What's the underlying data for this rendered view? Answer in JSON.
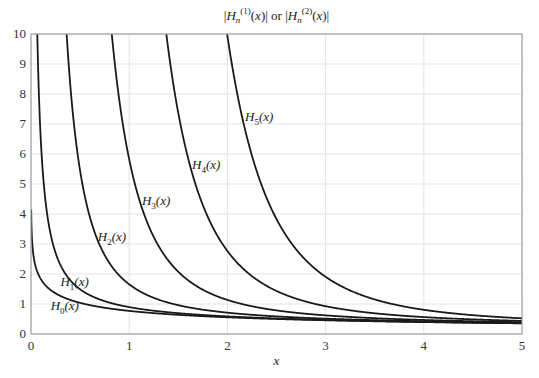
{
  "chart_data": {
    "type": "line",
    "title_parts": {
      "pre": "|H",
      "n": "n",
      "sup1": "(1)",
      "mid": "(x)| or |H",
      "sup2": "(2)",
      "post": "(x)|"
    },
    "xlabel": "x",
    "ylabel": "",
    "xlim": [
      0,
      5
    ],
    "ylim": [
      0,
      10
    ],
    "x_ticks": [
      "0",
      "1",
      "2",
      "3",
      "4",
      "5"
    ],
    "y_ticks": [
      "0",
      "1",
      "2",
      "3",
      "4",
      "5",
      "6",
      "7",
      "8",
      "9",
      "10"
    ],
    "grid": true,
    "function": "sqrt(J_n(x)^2 + Y_n(x)^2)",
    "series": [
      {
        "name": "H0(x)",
        "label_base": "H",
        "label_sub": "0",
        "label_tail": "(x)",
        "order": 0,
        "label_at": [
          0.2,
          0.8
        ]
      },
      {
        "name": "H1(x)",
        "label_base": "H",
        "label_sub": "1",
        "label_tail": "(x)",
        "order": 1,
        "label_at": [
          0.3,
          1.6
        ]
      },
      {
        "name": "H2(x)",
        "label_base": "H",
        "label_sub": "2",
        "label_tail": "(x)",
        "order": 2,
        "label_at": [
          0.68,
          3.1
        ]
      },
      {
        "name": "H3(x)",
        "label_base": "H",
        "label_sub": "3",
        "label_tail": "(x)",
        "order": 3,
        "label_at": [
          1.13,
          4.3
        ]
      },
      {
        "name": "H4(x)",
        "label_base": "H",
        "label_sub": "4",
        "label_tail": "(x)",
        "order": 4,
        "label_at": [
          1.64,
          5.5
        ]
      },
      {
        "name": "H5(x)",
        "label_base": "H",
        "label_sub": "5",
        "label_tail": "(x)",
        "order": 5,
        "label_at": [
          2.18,
          7.1
        ]
      }
    ],
    "sample_points": {
      "x": [
        0.5,
        1,
        2,
        3,
        4,
        5
      ],
      "H0": [
        1.49,
        0.97,
        0.64,
        0.47,
        0.4,
        0.36
      ],
      "H1": [
        1.49,
        0.97,
        0.64,
        0.47,
        0.4,
        0.36
      ]
    }
  }
}
